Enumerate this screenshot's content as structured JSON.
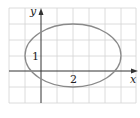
{
  "figure": {
    "type": "coordinate-plot",
    "axes": {
      "x_label": "x",
      "y_label": "y"
    },
    "tick_labels": {
      "x_tick": "2",
      "y_tick": "1"
    },
    "ellipse": {
      "center": [
        2,
        1
      ],
      "semi_axis_x": 3,
      "semi_axis_y": 2,
      "equation": "(x-2)^2/9 + (y-1)^2/4 = 1"
    },
    "colors": {
      "grid": "#d0d0d0",
      "axes": "#333333",
      "curve": "#888888"
    }
  }
}
